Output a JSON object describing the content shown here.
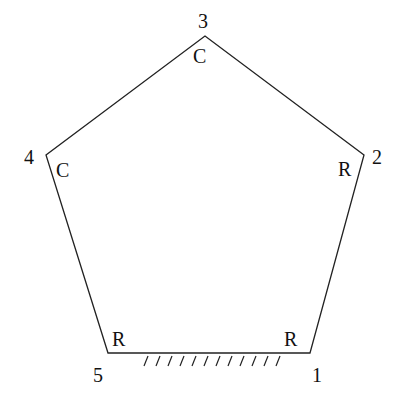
{
  "diagram": {
    "type": "pentagon-linkage",
    "vertices": [
      {
        "id": "1",
        "label": "1",
        "joint": "R",
        "x": 310,
        "y": 353
      },
      {
        "id": "2",
        "label": "2",
        "joint": "R",
        "x": 364,
        "y": 155
      },
      {
        "id": "3",
        "label": "3",
        "joint": "C",
        "x": 205,
        "y": 36
      },
      {
        "id": "4",
        "label": "4",
        "joint": "C",
        "x": 46,
        "y": 155
      },
      {
        "id": "5",
        "label": "5",
        "joint": "R",
        "x": 108,
        "y": 353
      }
    ],
    "ground": {
      "between": [
        "5",
        "1"
      ],
      "hatch_count": 12
    },
    "stroke_color": "#222222"
  }
}
